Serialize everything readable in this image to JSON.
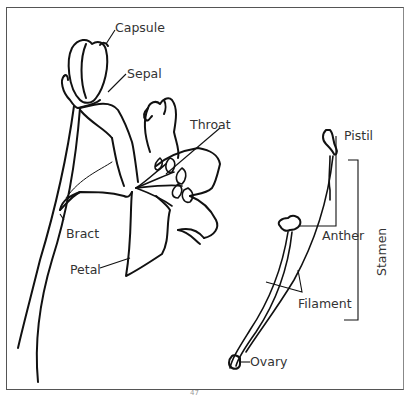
{
  "diagram": {
    "labels": {
      "capsule": "Capsule",
      "sepal": "Sepal",
      "throat": "Throat",
      "bract": "Bract",
      "petal": "Petal",
      "pistil": "Pistil",
      "anther": "Anther",
      "filament": "Filament",
      "stamen": "Stamen",
      "ovary": "Ovary"
    },
    "page_number": "47",
    "colors": {
      "line": "#111111",
      "text": "#333333",
      "frame": "#555555"
    }
  }
}
